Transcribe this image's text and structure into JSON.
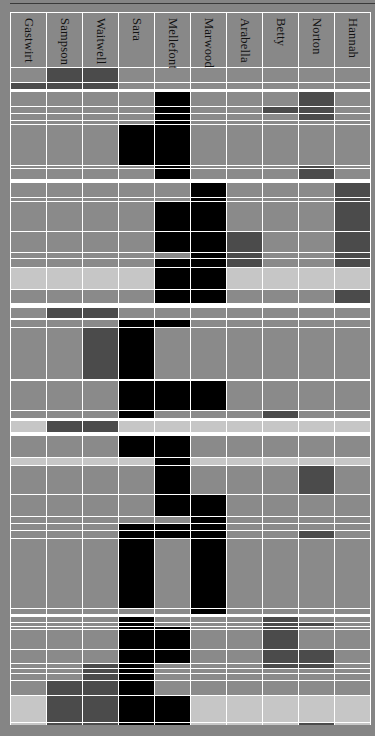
{
  "chart_data": {
    "type": "heatmap",
    "title": "",
    "columns": [
      "Gastwirt",
      "Sampson",
      "Waitwell",
      "Sara",
      "Mellefont",
      "Marwood",
      "Arabella",
      "Betty",
      "Norton",
      "Hannah"
    ],
    "legend": {
      "0": "absent",
      "1": "dark gray",
      "2": "black"
    },
    "colors": {
      "absent": "#8a8a8a",
      "light": "#c6c6c6",
      "dark": "#4b4b4b",
      "black": "#000000",
      "grid": "#ffffff"
    },
    "acts": [
      {
        "name": "Act 1",
        "rows": [
          {
            "y": 68,
            "h": 14,
            "light": false,
            "v": [
              0,
              1,
              1,
              0,
              0,
              0,
              0,
              0,
              0,
              0
            ]
          },
          {
            "y": 83,
            "h": 6,
            "light": false,
            "v": [
              1,
              1,
              1,
              0,
              0,
              0,
              0,
              0,
              0,
              0
            ]
          }
        ]
      },
      {
        "name": "Act 2",
        "rows": [
          {
            "y": 92,
            "h": 14,
            "light": false,
            "v": [
              0,
              0,
              0,
              0,
              2,
              0,
              0,
              0,
              1,
              0
            ]
          },
          {
            "y": 107,
            "h": 6,
            "light": false,
            "v": [
              0,
              0,
              0,
              0,
              2,
              0,
              0,
              1,
              1,
              0
            ]
          },
          {
            "y": 114,
            "h": 6,
            "light": false,
            "v": [
              0,
              0,
              0,
              0,
              2,
              0,
              0,
              0,
              1,
              0
            ]
          },
          {
            "y": 121,
            "h": 3,
            "light": false,
            "v": [
              0,
              0,
              0,
              0,
              2,
              0,
              0,
              0,
              0,
              0
            ]
          },
          {
            "y": 125,
            "h": 40,
            "light": false,
            "v": [
              0,
              0,
              0,
              2,
              2,
              0,
              0,
              0,
              0,
              0
            ]
          },
          {
            "y": 166,
            "h": 2,
            "light": false,
            "v": [
              0,
              0,
              0,
              0,
              2,
              0,
              0,
              0,
              1,
              0
            ]
          },
          {
            "y": 169,
            "h": 10,
            "light": false,
            "v": [
              0,
              0,
              0,
              0,
              2,
              0,
              0,
              0,
              1,
              0
            ]
          }
        ]
      },
      {
        "name": "Act 3",
        "rows": [
          {
            "y": 183,
            "h": 14,
            "light": false,
            "v": [
              0,
              0,
              0,
              0,
              0,
              2,
              0,
              0,
              0,
              1
            ]
          },
          {
            "y": 198,
            "h": 3,
            "light": false,
            "v": [
              0,
              0,
              0,
              0,
              0,
              2,
              0,
              0,
              0,
              1
            ]
          },
          {
            "y": 202,
            "h": 29,
            "light": false,
            "v": [
              0,
              0,
              0,
              0,
              2,
              2,
              0,
              0,
              0,
              1
            ]
          },
          {
            "y": 232,
            "h": 20,
            "light": false,
            "v": [
              0,
              0,
              0,
              0,
              2,
              2,
              1,
              0,
              0,
              1
            ]
          },
          {
            "y": 253,
            "h": 5,
            "light": false,
            "v": [
              0,
              0,
              0,
              0,
              0,
              2,
              1,
              0,
              0,
              1
            ]
          },
          {
            "y": 259,
            "h": 8,
            "light": false,
            "v": [
              0,
              0,
              0,
              0,
              2,
              2,
              1,
              0,
              0,
              1
            ]
          },
          {
            "y": 268,
            "h": 21,
            "light": true,
            "v": [
              0,
              0,
              0,
              0,
              2,
              2,
              0,
              0,
              0,
              0
            ]
          },
          {
            "y": 290,
            "h": 13,
            "light": false,
            "v": [
              0,
              0,
              0,
              0,
              2,
              2,
              0,
              0,
              0,
              1
            ]
          }
        ]
      },
      {
        "name": "Act 4",
        "rows": [
          {
            "y": 308,
            "h": 10,
            "light": false,
            "v": [
              0,
              1,
              1,
              0,
              0,
              0,
              0,
              0,
              0,
              0
            ]
          },
          {
            "y": 320,
            "h": 7,
            "light": false,
            "v": [
              0,
              0,
              0,
              2,
              2,
              0,
              0,
              0,
              0,
              0
            ]
          },
          {
            "y": 328,
            "h": 51,
            "light": false,
            "v": [
              0,
              0,
              1,
              2,
              0,
              0,
              0,
              0,
              0,
              0
            ]
          },
          {
            "y": 381,
            "h": 29,
            "light": false,
            "v": [
              0,
              0,
              0,
              2,
              2,
              2,
              0,
              0,
              0,
              0
            ]
          },
          {
            "y": 411,
            "h": 7,
            "light": false,
            "v": [
              0,
              0,
              0,
              2,
              0,
              0,
              0,
              1,
              0,
              0
            ]
          },
          {
            "y": 421,
            "h": 11,
            "light": true,
            "v": [
              0,
              1,
              1,
              0,
              0,
              0,
              0,
              0,
              0,
              0
            ]
          }
        ]
      },
      {
        "name": "Act 5",
        "rows": [
          {
            "y": 436,
            "h": 21,
            "light": false,
            "v": [
              0,
              0,
              0,
              2,
              2,
              0,
              0,
              0,
              0,
              0
            ]
          },
          {
            "y": 458,
            "h": 7,
            "light": true,
            "v": [
              0,
              0,
              0,
              0,
              2,
              0,
              0,
              0,
              0,
              0
            ]
          },
          {
            "y": 466,
            "h": 28,
            "light": false,
            "v": [
              0,
              0,
              0,
              0,
              2,
              0,
              0,
              0,
              1,
              0
            ]
          },
          {
            "y": 495,
            "h": 21,
            "light": false,
            "v": [
              0,
              0,
              0,
              0,
              2,
              2,
              0,
              0,
              0,
              0
            ]
          },
          {
            "y": 517,
            "h": 6,
            "light": false,
            "v": [
              0,
              0,
              0,
              0,
              0,
              2,
              0,
              0,
              0,
              0
            ]
          },
          {
            "y": 524,
            "h": 6,
            "light": false,
            "v": [
              0,
              0,
              0,
              2,
              2,
              2,
              0,
              0,
              0,
              0
            ]
          },
          {
            "y": 531,
            "h": 7,
            "light": false,
            "v": [
              0,
              0,
              0,
              2,
              2,
              2,
              0,
              0,
              1,
              0
            ]
          },
          {
            "y": 539,
            "h": 69,
            "light": false,
            "v": [
              0,
              0,
              0,
              2,
              0,
              2,
              0,
              0,
              0,
              0
            ]
          },
          {
            "y": 609,
            "h": 5,
            "light": false,
            "v": [
              0,
              0,
              0,
              0,
              0,
              2,
              0,
              0,
              0,
              0
            ]
          }
        ]
      },
      {
        "name": "Act 6",
        "rows": [
          {
            "y": 617,
            "h": 5,
            "light": false,
            "v": [
              0,
              0,
              0,
              2,
              0,
              0,
              0,
              1,
              0,
              0
            ]
          },
          {
            "y": 623,
            "h": 3,
            "light": false,
            "v": [
              0,
              0,
              0,
              2,
              0,
              0,
              0,
              1,
              1,
              0
            ]
          },
          {
            "y": 627,
            "h": 2,
            "light": false,
            "v": [
              0,
              0,
              0,
              2,
              2,
              0,
              0,
              1,
              0,
              0
            ]
          },
          {
            "y": 630,
            "h": 19,
            "light": false,
            "v": [
              0,
              0,
              0,
              2,
              2,
              0,
              0,
              1,
              0,
              0
            ]
          },
          {
            "y": 650,
            "h": 13,
            "light": false,
            "v": [
              0,
              0,
              0,
              2,
              2,
              0,
              0,
              1,
              1,
              0
            ]
          },
          {
            "y": 664,
            "h": 4,
            "light": false,
            "v": [
              0,
              0,
              1,
              2,
              0,
              0,
              0,
              1,
              1,
              0
            ]
          },
          {
            "y": 669,
            "h": 4,
            "light": false,
            "v": [
              0,
              0,
              1,
              2,
              0,
              0,
              0,
              0,
              0,
              0
            ]
          },
          {
            "y": 674,
            "h": 6,
            "light": false,
            "v": [
              0,
              0,
              1,
              2,
              0,
              0,
              0,
              0,
              0,
              0
            ]
          },
          {
            "y": 681,
            "h": 14,
            "light": false,
            "v": [
              0,
              1,
              1,
              2,
              0,
              0,
              0,
              0,
              0,
              0
            ]
          },
          {
            "y": 696,
            "h": 26,
            "light": true,
            "v": [
              0,
              1,
              1,
              2,
              2,
              0,
              0,
              0,
              0,
              0
            ]
          },
          {
            "y": 723,
            "h": 2,
            "light": true,
            "v": [
              0,
              1,
              1,
              2,
              2,
              0,
              0,
              0,
              1,
              0
            ]
          }
        ]
      }
    ]
  }
}
